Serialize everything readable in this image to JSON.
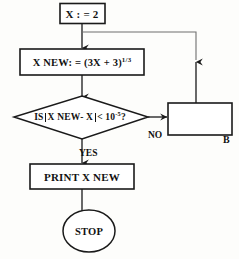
{
  "diagram": {
    "stroke_color": "#1a1a1a",
    "fill_color": "#ffffff",
    "background": "#fdfdfb"
  },
  "nodes": {
    "start": {
      "shape": "rectangle",
      "text": "X : = 2",
      "var": "X",
      "operator": ":=",
      "value": "2"
    },
    "assign": {
      "shape": "rectangle",
      "text_prefix": "X NEW: = (3X + 3)",
      "exponent": "1/3",
      "full_text": "X NEW: = (3X + 3)^(1/3)"
    },
    "decision": {
      "shape": "diamond",
      "prefix": "IS",
      "abs_expr": "X NEW- X",
      "comparator": "< 10",
      "exponent": "-5",
      "suffix": "?",
      "full_text": "IS |X NEW - X| < 10^-5 ?"
    },
    "print": {
      "shape": "rectangle",
      "text": "PRINT X NEW"
    },
    "stop": {
      "shape": "ellipse",
      "text": "STOP"
    },
    "b_box": {
      "shape": "rectangle",
      "text": "",
      "corner_label": "B"
    }
  },
  "edges": {
    "no_label": "NO",
    "yes_label": "YES",
    "b_label": "B"
  }
}
